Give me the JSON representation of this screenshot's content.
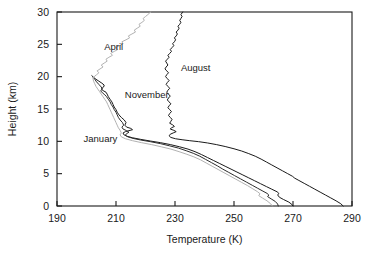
{
  "chart_data": {
    "type": "line",
    "title": "",
    "xlabel": "Temperature (K)",
    "ylabel": "Height (km)",
    "xlim": [
      190,
      290
    ],
    "ylim": [
      0,
      30
    ],
    "xticks": [
      190,
      210,
      230,
      250,
      270,
      290
    ],
    "yticks": [
      0,
      5,
      10,
      15,
      20,
      25,
      30
    ],
    "grid": false,
    "legend_position": "inline-annotations",
    "x_is_value_axis": true,
    "note": "Vertical temperature profiles: x = Temperature (K), y = Height (km)",
    "series": [
      {
        "name": "January",
        "color": "#1a1a1a",
        "label_x": 199,
        "label_y": 10.4,
        "points": [
          [
            270.0,
            0.0
          ],
          [
            269.6,
            0.25
          ],
          [
            268.6,
            0.6
          ],
          [
            266.8,
            1.0
          ],
          [
            265.4,
            1.35
          ],
          [
            264.8,
            1.7
          ],
          [
            265.2,
            1.95
          ],
          [
            264.6,
            2.2
          ],
          [
            262.8,
            2.6
          ],
          [
            261.0,
            3.0
          ],
          [
            259.0,
            3.45
          ],
          [
            257.0,
            3.9
          ],
          [
            255.0,
            4.35
          ],
          [
            253.0,
            4.8
          ],
          [
            251.0,
            5.25
          ],
          [
            249.0,
            5.7
          ],
          [
            247.0,
            6.15
          ],
          [
            245.0,
            6.6
          ],
          [
            243.0,
            7.05
          ],
          [
            241.0,
            7.5
          ],
          [
            239.0,
            7.95
          ],
          [
            236.8,
            8.4
          ],
          [
            234.4,
            8.8
          ],
          [
            231.6,
            9.15
          ],
          [
            228.4,
            9.5
          ],
          [
            225.0,
            9.8
          ],
          [
            221.6,
            10.05
          ],
          [
            218.4,
            10.3
          ],
          [
            215.6,
            10.55
          ],
          [
            213.6,
            10.8
          ],
          [
            212.6,
            11.05
          ],
          [
            212.4,
            11.3
          ],
          [
            213.2,
            11.5
          ],
          [
            214.4,
            11.65
          ],
          [
            215.6,
            11.8
          ],
          [
            215.0,
            12.0
          ],
          [
            213.6,
            12.2
          ],
          [
            213.0,
            12.5
          ],
          [
            213.4,
            12.9
          ],
          [
            212.8,
            13.3
          ],
          [
            211.8,
            13.7
          ],
          [
            211.0,
            14.1
          ],
          [
            210.4,
            14.5
          ],
          [
            210.0,
            14.9
          ],
          [
            209.4,
            15.3
          ],
          [
            209.0,
            15.7
          ],
          [
            208.6,
            16.1
          ],
          [
            208.0,
            16.5
          ],
          [
            207.4,
            16.9
          ],
          [
            207.0,
            17.3
          ],
          [
            206.6,
            17.6
          ],
          [
            205.6,
            17.85
          ],
          [
            205.0,
            18.1
          ],
          [
            205.8,
            18.4
          ],
          [
            206.0,
            18.7
          ],
          [
            205.2,
            19.0
          ],
          [
            204.2,
            19.3
          ],
          [
            203.2,
            19.6
          ],
          [
            202.4,
            19.9
          ],
          [
            201.8,
            20.15
          ]
        ]
      },
      {
        "name": "November",
        "color": "#2b2b2b",
        "label_x": 213,
        "label_y": 17.3,
        "points": [
          [
            265.0,
            0.0
          ],
          [
            264.8,
            0.3
          ],
          [
            264.0,
            0.7
          ],
          [
            262.6,
            1.1
          ],
          [
            261.4,
            1.45
          ],
          [
            261.8,
            1.7
          ],
          [
            261.2,
            1.95
          ],
          [
            259.8,
            2.3
          ],
          [
            258.0,
            2.75
          ],
          [
            256.2,
            3.2
          ],
          [
            254.2,
            3.7
          ],
          [
            252.2,
            4.2
          ],
          [
            250.2,
            4.7
          ],
          [
            248.2,
            5.2
          ],
          [
            246.2,
            5.7
          ],
          [
            244.4,
            6.2
          ],
          [
            242.4,
            6.7
          ],
          [
            240.4,
            7.2
          ],
          [
            238.4,
            7.7
          ],
          [
            236.2,
            8.15
          ],
          [
            233.8,
            8.55
          ],
          [
            231.2,
            8.95
          ],
          [
            228.2,
            9.3
          ],
          [
            225.0,
            9.65
          ],
          [
            221.6,
            9.95
          ],
          [
            218.4,
            10.2
          ],
          [
            215.8,
            10.45
          ],
          [
            214.0,
            10.7
          ],
          [
            213.2,
            10.95
          ],
          [
            213.6,
            11.2
          ],
          [
            214.4,
            11.4
          ],
          [
            213.6,
            11.65
          ],
          [
            212.4,
            11.9
          ],
          [
            212.0,
            12.2
          ],
          [
            212.6,
            12.5
          ],
          [
            212.2,
            12.9
          ],
          [
            211.4,
            13.3
          ],
          [
            210.8,
            13.7
          ],
          [
            210.4,
            14.1
          ],
          [
            210.0,
            14.5
          ],
          [
            209.4,
            14.9
          ],
          [
            209.0,
            15.3
          ],
          [
            208.4,
            15.7
          ],
          [
            208.0,
            16.1
          ],
          [
            207.4,
            16.5
          ],
          [
            206.8,
            16.9
          ],
          [
            206.2,
            17.2
          ],
          [
            205.4,
            17.5
          ],
          [
            204.8,
            17.8
          ],
          [
            205.4,
            18.1
          ],
          [
            205.0,
            18.4
          ],
          [
            204.2,
            18.8
          ],
          [
            203.4,
            19.2
          ],
          [
            202.8,
            19.6
          ],
          [
            202.2,
            19.9
          ]
        ]
      },
      {
        "name": "April",
        "color": "#b2b2b2",
        "label_x": 206,
        "label_y": 24.6,
        "points": [
          [
            263.0,
            0.0
          ],
          [
            262.4,
            0.35
          ],
          [
            261.2,
            0.8
          ],
          [
            259.6,
            1.25
          ],
          [
            258.4,
            1.6
          ],
          [
            258.8,
            1.9
          ],
          [
            258.0,
            2.2
          ],
          [
            256.4,
            2.65
          ],
          [
            254.6,
            3.15
          ],
          [
            252.6,
            3.65
          ],
          [
            250.6,
            4.15
          ],
          [
            248.6,
            4.65
          ],
          [
            246.6,
            5.15
          ],
          [
            244.6,
            5.65
          ],
          [
            242.6,
            6.15
          ],
          [
            240.6,
            6.65
          ],
          [
            238.6,
            7.15
          ],
          [
            236.4,
            7.6
          ],
          [
            234.0,
            8.0
          ],
          [
            231.4,
            8.4
          ],
          [
            228.6,
            8.8
          ],
          [
            225.4,
            9.15
          ],
          [
            222.0,
            9.5
          ],
          [
            218.6,
            9.8
          ],
          [
            215.6,
            10.1
          ],
          [
            213.2,
            10.4
          ],
          [
            211.8,
            10.7
          ],
          [
            211.4,
            11.0
          ],
          [
            211.8,
            11.3
          ],
          [
            211.4,
            11.7
          ],
          [
            210.8,
            12.1
          ],
          [
            210.4,
            12.5
          ],
          [
            210.0,
            12.9
          ],
          [
            209.6,
            13.3
          ],
          [
            209.2,
            13.7
          ],
          [
            208.8,
            14.1
          ],
          [
            208.4,
            14.5
          ],
          [
            208.0,
            14.9
          ],
          [
            207.6,
            15.3
          ],
          [
            207.2,
            15.7
          ],
          [
            206.8,
            16.1
          ],
          [
            206.2,
            16.5
          ],
          [
            205.6,
            16.9
          ],
          [
            205.0,
            17.3
          ],
          [
            204.4,
            17.7
          ],
          [
            203.8,
            18.1
          ],
          [
            203.2,
            18.5
          ],
          [
            202.8,
            18.9
          ],
          [
            202.4,
            19.3
          ],
          [
            202.2,
            19.7
          ],
          [
            202.6,
            20.0
          ],
          [
            203.4,
            20.3
          ],
          [
            204.2,
            20.6
          ],
          [
            203.6,
            20.9
          ],
          [
            204.6,
            21.2
          ],
          [
            205.6,
            21.5
          ],
          [
            205.0,
            21.8
          ],
          [
            206.0,
            22.1
          ],
          [
            207.0,
            22.4
          ],
          [
            206.6,
            22.7
          ],
          [
            207.6,
            23.0
          ],
          [
            208.8,
            23.3
          ],
          [
            208.2,
            23.6
          ],
          [
            209.4,
            23.9
          ],
          [
            210.6,
            24.2
          ],
          [
            210.0,
            24.5
          ],
          [
            211.2,
            24.8
          ],
          [
            212.4,
            25.1
          ],
          [
            212.0,
            25.4
          ],
          [
            213.4,
            25.7
          ],
          [
            214.6,
            26.0
          ],
          [
            214.2,
            26.3
          ],
          [
            215.4,
            26.6
          ],
          [
            216.6,
            26.9
          ],
          [
            216.2,
            27.2
          ],
          [
            217.2,
            27.5
          ],
          [
            218.2,
            27.8
          ],
          [
            217.8,
            28.1
          ],
          [
            218.8,
            28.4
          ],
          [
            219.6,
            28.7
          ],
          [
            219.2,
            29.0
          ],
          [
            220.0,
            29.3
          ],
          [
            220.8,
            29.6
          ],
          [
            221.4,
            29.85
          ],
          [
            221.8,
            30.0
          ]
        ]
      },
      {
        "name": "August",
        "color": "#1a1a1a",
        "label_x": 232,
        "label_y": 21.4,
        "points": [
          [
            287.0,
            0.0
          ],
          [
            286.2,
            0.35
          ],
          [
            284.6,
            0.8
          ],
          [
            282.8,
            1.25
          ],
          [
            281.0,
            1.7
          ],
          [
            279.2,
            2.15
          ],
          [
            277.4,
            2.6
          ],
          [
            275.6,
            3.05
          ],
          [
            273.8,
            3.5
          ],
          [
            272.0,
            3.95
          ],
          [
            270.6,
            4.3
          ],
          [
            269.8,
            4.6
          ],
          [
            268.2,
            5.0
          ],
          [
            266.4,
            5.45
          ],
          [
            264.6,
            5.9
          ],
          [
            262.8,
            6.35
          ],
          [
            261.0,
            6.8
          ],
          [
            259.2,
            7.25
          ],
          [
            257.2,
            7.7
          ],
          [
            255.0,
            8.1
          ],
          [
            252.6,
            8.5
          ],
          [
            250.0,
            8.85
          ],
          [
            247.0,
            9.2
          ],
          [
            244.0,
            9.5
          ],
          [
            241.0,
            9.75
          ],
          [
            238.0,
            9.95
          ],
          [
            235.0,
            10.1
          ],
          [
            232.4,
            10.25
          ],
          [
            230.2,
            10.4
          ],
          [
            228.6,
            10.6
          ],
          [
            228.0,
            10.85
          ],
          [
            228.4,
            11.1
          ],
          [
            229.4,
            11.3
          ],
          [
            230.4,
            11.5
          ],
          [
            229.6,
            11.7
          ],
          [
            228.4,
            11.9
          ],
          [
            228.8,
            12.1
          ],
          [
            229.8,
            12.3
          ],
          [
            229.2,
            12.55
          ],
          [
            228.2,
            12.8
          ],
          [
            228.6,
            13.1
          ],
          [
            229.0,
            13.4
          ],
          [
            228.4,
            13.7
          ],
          [
            227.8,
            14.0
          ],
          [
            228.2,
            14.3
          ],
          [
            228.8,
            14.6
          ],
          [
            228.2,
            14.9
          ],
          [
            227.6,
            15.2
          ],
          [
            228.0,
            15.5
          ],
          [
            228.6,
            15.8
          ],
          [
            228.0,
            16.1
          ],
          [
            227.4,
            16.4
          ],
          [
            227.8,
            16.7
          ],
          [
            228.4,
            17.0
          ],
          [
            227.8,
            17.3
          ],
          [
            227.2,
            17.6
          ],
          [
            227.6,
            17.9
          ],
          [
            228.2,
            18.2
          ],
          [
            227.6,
            18.5
          ],
          [
            227.0,
            18.8
          ],
          [
            227.4,
            19.1
          ],
          [
            228.0,
            19.4
          ],
          [
            227.4,
            19.7
          ],
          [
            226.8,
            20.0
          ],
          [
            227.2,
            20.3
          ],
          [
            227.8,
            20.6
          ],
          [
            227.2,
            20.9
          ],
          [
            226.6,
            21.2
          ],
          [
            227.0,
            21.5
          ],
          [
            227.6,
            21.8
          ],
          [
            227.2,
            22.1
          ],
          [
            226.8,
            22.4
          ],
          [
            227.4,
            22.7
          ],
          [
            228.0,
            23.0
          ],
          [
            227.6,
            23.3
          ],
          [
            228.2,
            23.6
          ],
          [
            228.8,
            23.9
          ],
          [
            228.4,
            24.2
          ],
          [
            229.0,
            24.5
          ],
          [
            229.6,
            24.8
          ],
          [
            229.2,
            25.1
          ],
          [
            229.8,
            25.4
          ],
          [
            230.2,
            25.7
          ],
          [
            229.8,
            26.0
          ],
          [
            230.4,
            26.3
          ],
          [
            230.8,
            26.6
          ],
          [
            230.4,
            26.9
          ],
          [
            231.0,
            27.2
          ],
          [
            231.4,
            27.5
          ],
          [
            231.0,
            27.8
          ],
          [
            231.6,
            28.1
          ],
          [
            232.0,
            28.4
          ],
          [
            231.6,
            28.7
          ],
          [
            232.0,
            29.0
          ],
          [
            232.4,
            29.3
          ],
          [
            232.0,
            29.6
          ],
          [
            232.4,
            29.85
          ],
          [
            232.6,
            30.0
          ]
        ]
      }
    ]
  },
  "axes": {
    "x_title": "Temperature (K)",
    "y_title": "Height (km)",
    "x_tick_labels": [
      "190",
      "210",
      "230",
      "250",
      "270",
      "290"
    ],
    "y_tick_labels": [
      "0",
      "5",
      "10",
      "15",
      "20",
      "25",
      "30"
    ]
  },
  "annotations": {
    "january": "January",
    "november": "November",
    "april": "April",
    "august": "August"
  },
  "colors": {
    "frame": "#1a1a1a",
    "text": "#1a1a1a",
    "january_line": "#1a1a1a",
    "november_line": "#2b2b2b",
    "april_line": "#b2b2b2",
    "august_line": "#1a1a1a",
    "background": "#ffffff"
  }
}
